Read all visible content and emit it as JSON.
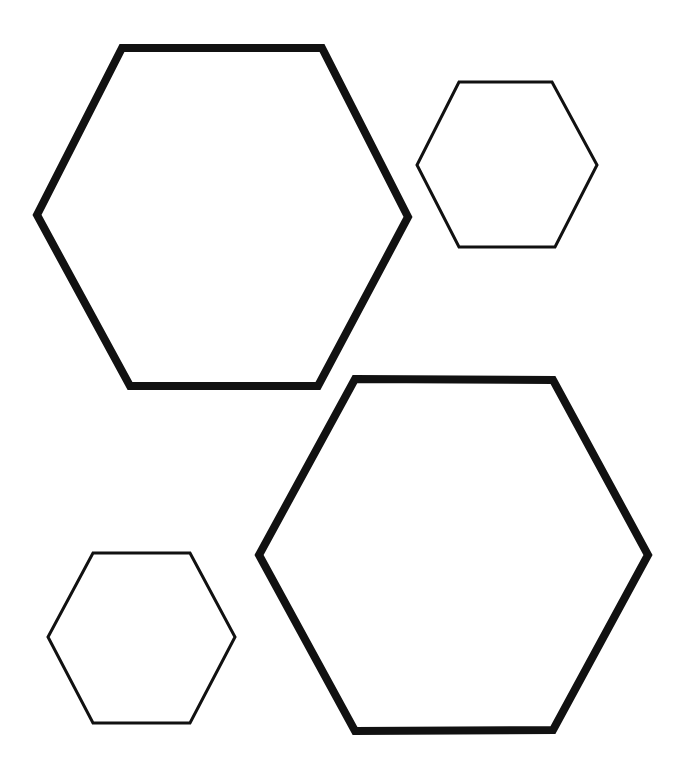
{
  "canvas": {
    "width": 689,
    "height": 776,
    "background_color": "#ffffff",
    "stroke_color": "#111111"
  },
  "chart_data": {
    "type": "diagram",
    "title": "",
    "shape_count": 4,
    "shapes": [
      {
        "name": "large-hexagon-top-left",
        "shape": "hexagon",
        "orientation": "flat-top",
        "size_class": "large",
        "stroke_width": 8,
        "stroke_color": "#111111",
        "fill": "none",
        "center": [
          222,
          217
        ],
        "width": 371,
        "height": 338,
        "vertices": [
          [
            122,
            48
          ],
          [
            322,
            48
          ],
          [
            408,
            217
          ],
          [
            318,
            386
          ],
          [
            130,
            386
          ],
          [
            37,
            215
          ]
        ]
      },
      {
        "name": "small-hexagon-top-right",
        "shape": "hexagon",
        "orientation": "flat-top",
        "size_class": "small",
        "stroke_width": 3,
        "stroke_color": "#111111",
        "fill": "none",
        "center": [
          507,
          165
        ],
        "width": 180,
        "height": 165,
        "vertices": [
          [
            459,
            82
          ],
          [
            552,
            82
          ],
          [
            597,
            165
          ],
          [
            555,
            247
          ],
          [
            459,
            247
          ],
          [
            417,
            165
          ]
        ]
      },
      {
        "name": "large-hexagon-bottom-right",
        "shape": "hexagon",
        "orientation": "flat-top",
        "size_class": "large",
        "stroke_width": 8,
        "stroke_color": "#111111",
        "fill": "none",
        "center": [
          453,
          555
        ],
        "width": 389,
        "height": 352,
        "vertices": [
          [
            355,
            379
          ],
          [
            553,
            380
          ],
          [
            648,
            555
          ],
          [
            553,
            730
          ],
          [
            355,
            731
          ],
          [
            259,
            555
          ]
        ]
      },
      {
        "name": "small-hexagon-bottom-left",
        "shape": "hexagon",
        "orientation": "flat-top",
        "size_class": "small",
        "stroke_width": 3,
        "stroke_color": "#111111",
        "fill": "none",
        "center": [
          141,
          638
        ],
        "width": 187,
        "height": 170,
        "vertices": [
          [
            93,
            553
          ],
          [
            190,
            553
          ],
          [
            235,
            637
          ],
          [
            190,
            723
          ],
          [
            93,
            723
          ],
          [
            48,
            637
          ]
        ]
      }
    ]
  }
}
